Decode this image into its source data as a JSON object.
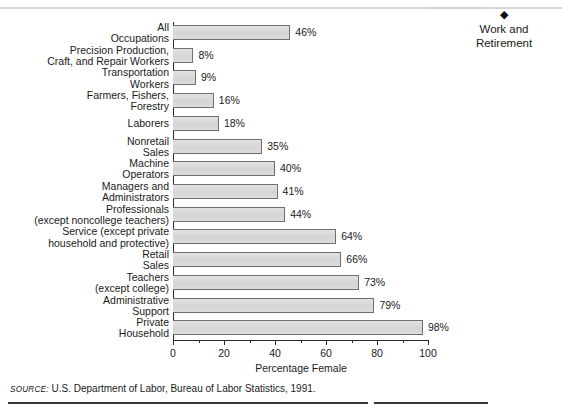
{
  "header": {
    "clipped_title": "",
    "side_marker_icon": "diamond-icon",
    "side_marker_glyph": "◆",
    "side_label": "Work and\nRetirement",
    "side_label_line1": "Work and",
    "side_label_line2": "Retirement"
  },
  "source": {
    "prefix": "SOURCE:",
    "text": "U.S. Department of Labor, Bureau of Labor Statistics, 1991."
  },
  "chart_data": {
    "type": "bar",
    "orientation": "horizontal",
    "title": "",
    "xlabel": "Percentage Female",
    "ylabel": "",
    "xlim": [
      0,
      100
    ],
    "xticks": [
      0,
      20,
      40,
      60,
      80,
      100
    ],
    "xtick_labels": [
      "0",
      "20",
      "40",
      "60",
      "80",
      "100"
    ],
    "minor_ticks": [
      10,
      30,
      50,
      70,
      90
    ],
    "grid": false,
    "legend": null,
    "value_suffix": "%",
    "bar_fill": "#d9d9d9",
    "bar_border": "#6f6f6f",
    "categories": [
      "All Occupations",
      "Precision Production, Craft, and Repair Workers",
      "Transportation Workers",
      "Farmers, Fishers, Forestry",
      "Laborers",
      "Nonretail Sales",
      "Machine Operators",
      "Managers and Administrators",
      "Professionals (except noncollege teachers)",
      "Service (except private household and protective)",
      "Retail Sales",
      "Teachers (except college)",
      "Administrative Support",
      "Private Household"
    ],
    "category_lines": [
      [
        "All",
        "Occupations"
      ],
      [
        "Precision Production,",
        "Craft, and Repair Workers"
      ],
      [
        "Transportation",
        "Workers"
      ],
      [
        "Farmers, Fishers,",
        "Forestry"
      ],
      [
        "Laborers"
      ],
      [
        "Nonretail",
        "Sales"
      ],
      [
        "Machine",
        "Operators"
      ],
      [
        "Managers and",
        "Administrators"
      ],
      [
        "Professionals",
        "(except noncollege teachers)"
      ],
      [
        "Service (except private",
        "household and protective)"
      ],
      [
        "Retail",
        "Sales"
      ],
      [
        "Teachers",
        "(except college)"
      ],
      [
        "Administrative",
        "Support"
      ],
      [
        "Private",
        "Household"
      ]
    ],
    "values": [
      46,
      8,
      9,
      16,
      18,
      35,
      40,
      41,
      44,
      64,
      66,
      73,
      79,
      98
    ],
    "value_labels": [
      "46%",
      "8%",
      "9%",
      "16%",
      "18%",
      "35%",
      "40%",
      "41%",
      "44%",
      "64%",
      "66%",
      "73%",
      "79%",
      "98%"
    ]
  }
}
